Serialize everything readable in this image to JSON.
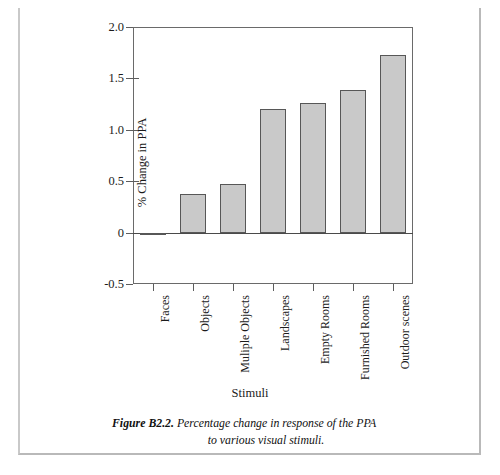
{
  "figure": {
    "caption_label": "Figure B2.2.",
    "caption_text": "Percentage change in response of the PPA",
    "caption_text_line2": "to various visual stimuli."
  },
  "chart_data": {
    "type": "bar",
    "title": "",
    "xlabel": "Stimuli",
    "ylabel": "% Change in PPA",
    "categories": [
      "Faces",
      "Objects",
      "Muliple Objects",
      "Landscapes",
      "Empty Rooms",
      "Furnished Rooms",
      "Outdoor scenes"
    ],
    "values": [
      -0.02,
      0.38,
      0.47,
      1.2,
      1.26,
      1.39,
      1.73
    ],
    "ylim": [
      -0.5,
      2.0
    ],
    "yticks": [
      2.0,
      1.5,
      1.0,
      0.5,
      0,
      -0.5
    ],
    "ytick_labels": [
      "2.0",
      "1.5",
      "1.0",
      "0.5",
      "0",
      "-0.5"
    ],
    "grid": false,
    "legend": null,
    "bar_fill_color": "#c9c9c9",
    "bar_edge_color": "#575757",
    "axis_color": "#5d5d5d"
  }
}
